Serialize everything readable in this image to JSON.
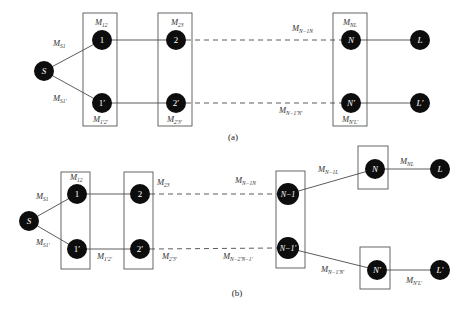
{
  "figure_a": {
    "caption": "(a)",
    "nodes": {
      "S": "S",
      "n1": "1",
      "n1p": "1′",
      "n2": "2",
      "n2p": "2′",
      "N": "N",
      "Np": "N′",
      "L": "L",
      "Lp": "L′"
    },
    "labels": {
      "MS1": {
        "main": "M",
        "sub": "S1"
      },
      "MS1p": {
        "main": "M",
        "sub": "S1′"
      },
      "M12": {
        "main": "M",
        "sub": "12"
      },
      "M1p2p": {
        "main": "M",
        "sub": "1′2′"
      },
      "M23": {
        "main": "M",
        "sub": "23"
      },
      "M2p3p": {
        "main": "M",
        "sub": "2′3′"
      },
      "MN1N": {
        "main": "M",
        "sub": "N−1N"
      },
      "MN1pNp": {
        "main": "M",
        "sub": "N−1′N′"
      },
      "MNL": {
        "main": "M",
        "sub": "NL"
      },
      "MNpLp": {
        "main": "M",
        "sub": "N′L′"
      }
    }
  },
  "figure_b": {
    "caption": "(b)",
    "nodes": {
      "S": "S",
      "n1": "1",
      "n1p": "1′",
      "n2": "2",
      "n2p": "2′",
      "Nm1": "N−1",
      "Nm1p": "N−1′",
      "N": "N",
      "Np": "N′",
      "L": "L",
      "Lp": "L′"
    },
    "labels": {
      "MS1": {
        "main": "M",
        "sub": "S1"
      },
      "MS1p": {
        "main": "M",
        "sub": "S1′"
      },
      "M12": {
        "main": "M",
        "sub": "12"
      },
      "M1p2p": {
        "main": "M",
        "sub": "1′2′"
      },
      "M23": {
        "main": "M",
        "sub": "23"
      },
      "M2p3p": {
        "main": "M",
        "sub": "2′3′"
      },
      "MN1N": {
        "main": "M",
        "sub": "N−1N"
      },
      "MN2pN1p": {
        "main": "M",
        "sub": "N−2′N−1′"
      },
      "MN1L": {
        "main": "M",
        "sub": "N−1L"
      },
      "MN1pNp": {
        "main": "M",
        "sub": "N−1′N′"
      },
      "MNL": {
        "main": "M",
        "sub": "NL"
      },
      "MNpLp": {
        "main": "M",
        "sub": "N′L′"
      }
    }
  }
}
